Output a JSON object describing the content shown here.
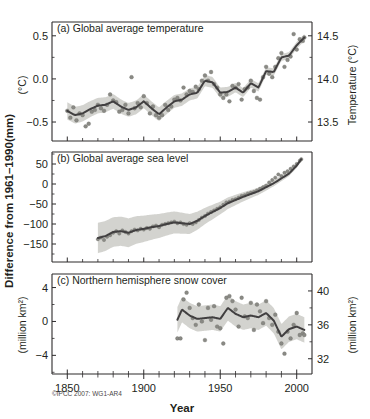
{
  "figure": {
    "credit": "©IPCC 2007: WG1-AR4",
    "x_axis_title": "Year",
    "left_axis_title": "Difference from 1961–1990",
    "left_axis_unit": "(mm)",
    "x_tick_labels": [
      "1850",
      "1900",
      "1950",
      "2000"
    ],
    "x_ticks": [
      1850,
      1900,
      1950,
      2000
    ],
    "x_range": [
      1840,
      2010
    ],
    "colors": {
      "line": "#413f40",
      "band": "#c9c9c4",
      "dot": "#8a8a85",
      "axis": "#2c2a2b",
      "text": "#231f20",
      "background": "#ffffff"
    }
  },
  "chart_data": [
    {
      "id": "panel-a",
      "type": "line",
      "title": "(a) Global average temperature",
      "ylabel": "(°C)",
      "ylabel_right": "Temperature (°C)",
      "xlabel": "Year",
      "grid": false,
      "legend": "none",
      "ylim": [
        -0.72,
        0.66
      ],
      "ylim_right": [
        13.28,
        14.66
      ],
      "yticks": [
        0.5,
        0.0,
        -0.5
      ],
      "ytick_labels": [
        "0.5",
        "0.0",
        "−0.5"
      ],
      "yticks_right": [
        14.5,
        14.0,
        13.5
      ],
      "ytick_labels_right": [
        "14.5",
        "14.0",
        "13.5"
      ],
      "xlim": [
        1840,
        2010
      ],
      "series": [
        {
          "name": "smoothed temperature anomaly",
          "x": [
            1850,
            1855,
            1860,
            1865,
            1870,
            1875,
            1880,
            1885,
            1890,
            1895,
            1900,
            1905,
            1910,
            1915,
            1920,
            1925,
            1930,
            1935,
            1940,
            1945,
            1950,
            1955,
            1960,
            1965,
            1970,
            1975,
            1980,
            1985,
            1990,
            1995,
            2000,
            2005
          ],
          "values": [
            -0.37,
            -0.42,
            -0.4,
            -0.35,
            -0.31,
            -0.3,
            -0.26,
            -0.32,
            -0.36,
            -0.33,
            -0.26,
            -0.34,
            -0.41,
            -0.33,
            -0.26,
            -0.24,
            -0.18,
            -0.16,
            -0.02,
            -0.04,
            -0.16,
            -0.15,
            -0.1,
            -0.16,
            -0.05,
            -0.1,
            0.09,
            0.08,
            0.25,
            0.27,
            0.39,
            0.48
          ]
        },
        {
          "name": "uncertainty band half-width",
          "x": [
            1850,
            1870,
            1890,
            1910,
            1930,
            1950,
            1970,
            1990,
            2005
          ],
          "values": [
            0.1,
            0.09,
            0.08,
            0.08,
            0.07,
            0.06,
            0.05,
            0.04,
            0.04
          ]
        }
      ],
      "scatter_x": [
        1850,
        1852,
        1854,
        1856,
        1858,
        1860,
        1862,
        1864,
        1866,
        1868,
        1870,
        1872,
        1874,
        1876,
        1878,
        1880,
        1882,
        1884,
        1886,
        1888,
        1890,
        1892,
        1894,
        1896,
        1898,
        1900,
        1902,
        1904,
        1906,
        1908,
        1910,
        1912,
        1914,
        1916,
        1918,
        1920,
        1922,
        1924,
        1926,
        1928,
        1930,
        1932,
        1934,
        1936,
        1938,
        1940,
        1942,
        1944,
        1946,
        1948,
        1950,
        1952,
        1954,
        1956,
        1958,
        1960,
        1962,
        1964,
        1966,
        1968,
        1970,
        1972,
        1974,
        1976,
        1978,
        1980,
        1982,
        1984,
        1986,
        1988,
        1990,
        1992,
        1994,
        1996,
        1998,
        2000,
        2002,
        2004,
        2005
      ],
      "scatter_y": [
        -0.37,
        -0.45,
        -0.33,
        -0.48,
        -0.4,
        -0.42,
        -0.55,
        -0.52,
        -0.38,
        -0.36,
        -0.3,
        -0.34,
        -0.37,
        -0.3,
        -0.18,
        -0.25,
        -0.27,
        -0.38,
        -0.36,
        -0.3,
        -0.4,
        0.02,
        -0.34,
        -0.28,
        -0.33,
        -0.2,
        -0.28,
        -0.4,
        -0.32,
        -0.42,
        -0.45,
        -0.42,
        -0.3,
        -0.36,
        -0.32,
        -0.24,
        -0.22,
        -0.25,
        -0.1,
        -0.18,
        -0.14,
        -0.15,
        -0.09,
        -0.12,
        -0.02,
        0.04,
        -0.02,
        0.08,
        -0.06,
        -0.1,
        -0.18,
        -0.22,
        -0.18,
        -0.26,
        -0.08,
        -0.1,
        -0.06,
        -0.24,
        -0.12,
        -0.1,
        -0.02,
        -0.14,
        -0.22,
        -0.24,
        0.02,
        0.14,
        0.06,
        0.02,
        0.14,
        0.24,
        0.3,
        0.14,
        0.22,
        0.26,
        0.52,
        0.34,
        0.46,
        0.44,
        0.48
      ]
    },
    {
      "id": "panel-b",
      "type": "line",
      "title": "(b) Global average sea level",
      "ylabel": "(mm)",
      "xlabel": "Year",
      "grid": false,
      "legend": "none",
      "ylim": [
        -195,
        80
      ],
      "yticks": [
        50,
        0,
        -50,
        -100,
        -150
      ],
      "ytick_labels": [
        "50",
        "0",
        "−50",
        "−100",
        "−150"
      ],
      "xlim": [
        1840,
        2010
      ],
      "series": [
        {
          "name": "smoothed sea level anomaly",
          "x": [
            1870,
            1875,
            1880,
            1885,
            1890,
            1895,
            1900,
            1905,
            1910,
            1915,
            1920,
            1925,
            1930,
            1935,
            1940,
            1945,
            1950,
            1955,
            1960,
            1965,
            1970,
            1975,
            1980,
            1985,
            1990,
            1995,
            2000,
            2003
          ],
          "values": [
            -135,
            -130,
            -120,
            -118,
            -122,
            -115,
            -112,
            -108,
            -105,
            -100,
            -96,
            -98,
            -100,
            -92,
            -80,
            -70,
            -60,
            -48,
            -40,
            -32,
            -25,
            -18,
            -8,
            2,
            14,
            26,
            46,
            62
          ]
        },
        {
          "name": "uncertainty band half-width",
          "x": [
            1870,
            1890,
            1910,
            1930,
            1950,
            1970,
            1990,
            2003
          ],
          "values": [
            38,
            36,
            30,
            25,
            16,
            10,
            7,
            5
          ]
        }
      ],
      "scatter_x": [
        1870,
        1872,
        1874,
        1876,
        1878,
        1880,
        1882,
        1884,
        1886,
        1888,
        1890,
        1892,
        1894,
        1896,
        1898,
        1900,
        1902,
        1904,
        1906,
        1908,
        1910,
        1912,
        1914,
        1916,
        1918,
        1920,
        1922,
        1924,
        1926,
        1928,
        1930,
        1932,
        1934,
        1936,
        1938,
        1940,
        1942,
        1944,
        1946,
        1948,
        1950,
        1952,
        1954,
        1956,
        1958,
        1960,
        1962,
        1964,
        1966,
        1968,
        1970,
        1972,
        1974,
        1976,
        1978,
        1980,
        1982,
        1984,
        1986,
        1988,
        1990,
        1992,
        1994,
        1996,
        1998,
        2000,
        2002,
        2003
      ],
      "scatter_y": [
        -138,
        -134,
        -140,
        -132,
        -128,
        -122,
        -118,
        -124,
        -116,
        -120,
        -124,
        -118,
        -114,
        -116,
        -112,
        -114,
        -110,
        -112,
        -106,
        -104,
        -108,
        -102,
        -100,
        -98,
        -96,
        -94,
        -98,
        -96,
        -100,
        -102,
        -98,
        -100,
        -96,
        -90,
        -84,
        -80,
        -74,
        -70,
        -66,
        -62,
        -58,
        -52,
        -46,
        -44,
        -40,
        -38,
        -34,
        -30,
        -28,
        -24,
        -22,
        -20,
        -16,
        -12,
        -8,
        -4,
        4,
        10,
        16,
        24,
        20,
        28,
        32,
        38,
        44,
        50,
        58,
        62
      ]
    },
    {
      "id": "panel-c",
      "type": "line",
      "title": "(c) Northern hemisphere snow cover",
      "ylabel": "(million km²)",
      "ylabel_right": "(million km²)",
      "xlabel": "Year",
      "grid": false,
      "legend": "none",
      "ylim": [
        -6.2,
        5.6
      ],
      "ylim_right": [
        30.2,
        42.0
      ],
      "yticks": [
        4,
        0,
        -4
      ],
      "ytick_labels": [
        "4",
        "0",
        "−4"
      ],
      "yticks_right": [
        40,
        36,
        32
      ],
      "ytick_labels_right": [
        "40",
        "36",
        "32"
      ],
      "xlim": [
        1840,
        2010
      ],
      "series": [
        {
          "name": "smoothed snow cover anomaly",
          "x": [
            1922,
            1925,
            1930,
            1935,
            1940,
            1945,
            1950,
            1955,
            1960,
            1965,
            1970,
            1975,
            1980,
            1985,
            1990,
            1995,
            2000,
            2005
          ],
          "values": [
            0.2,
            1.4,
            0.7,
            0.3,
            0.4,
            0.5,
            0.3,
            1.6,
            0.9,
            0.5,
            0.7,
            0.5,
            1.0,
            0.1,
            -1.8,
            -0.9,
            -0.6,
            -1.0
          ]
        },
        {
          "name": "uncertainty band half-width",
          "x": [
            1922,
            1940,
            1960,
            1980,
            2000,
            2005
          ],
          "values": [
            1.5,
            1.5,
            1.5,
            1.5,
            1.5,
            1.5
          ]
        }
      ],
      "scatter_x": [
        1922,
        1924,
        1926,
        1928,
        1930,
        1932,
        1934,
        1936,
        1938,
        1940,
        1942,
        1944,
        1946,
        1948,
        1950,
        1952,
        1954,
        1956,
        1958,
        1960,
        1962,
        1964,
        1966,
        1968,
        1970,
        1972,
        1974,
        1976,
        1978,
        1980,
        1982,
        1984,
        1986,
        1988,
        1990,
        1992,
        1994,
        1996,
        1998,
        2000,
        2002,
        2004,
        2005
      ],
      "scatter_y": [
        -2.0,
        -2.0,
        2.6,
        3.4,
        1.6,
        0.4,
        -0.4,
        2.0,
        0.0,
        -2.2,
        1.6,
        0.2,
        1.8,
        -0.6,
        -0.8,
        -2.6,
        2.8,
        3.0,
        2.4,
        1.4,
        -0.6,
        2.8,
        0.6,
        0.4,
        2.2,
        -1.0,
        2.0,
        1.2,
        -0.2,
        2.4,
        0.4,
        -0.4,
        0.8,
        -1.2,
        -2.6,
        -3.8,
        -1.2,
        -2.0,
        -0.4,
        1.0,
        -1.6,
        -1.4,
        -1.6
      ]
    }
  ]
}
